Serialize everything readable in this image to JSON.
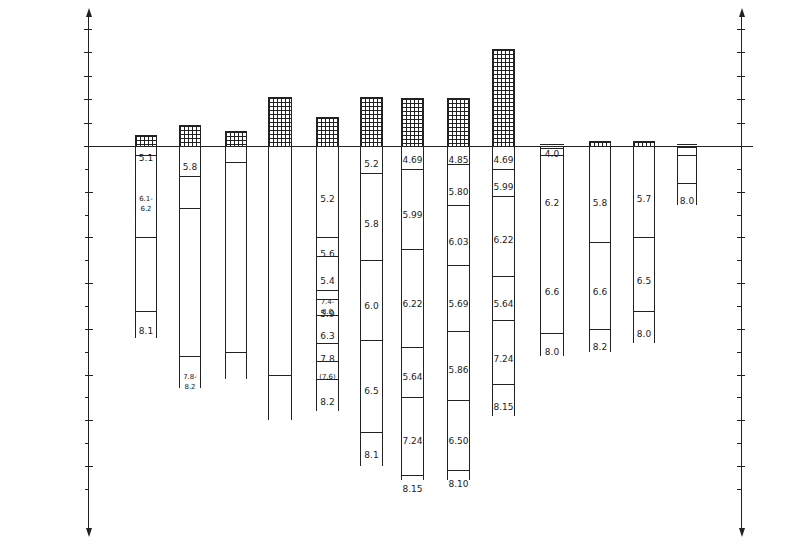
{
  "diagram": {
    "type": "crustal-velocity-columns",
    "y_label_top": "Elevation(km)",
    "y_label_bottom": "Depth(km)",
    "elevation_ticks": [
      "10",
      "8",
      "6",
      "4",
      "2",
      "0"
    ],
    "depth_ticks": [
      "10",
      "20",
      "30",
      "40",
      "50",
      "60",
      "70"
    ],
    "right_elevation_ticks": [
      "10",
      "8",
      "6",
      "4",
      "2",
      "0"
    ],
    "right_depth_ticks": [
      "10",
      "20",
      "30",
      "40",
      "50",
      "60",
      "70"
    ],
    "distance_label": "20",
    "columns": [
      {
        "id": "1",
        "elev_km": 0.9,
        "base_km": 42,
        "boundaries": [
          2,
          20,
          36
        ],
        "labels": [
          {
            "t": "5.1",
            "d": 1
          },
          {
            "t": "6.1-6.2",
            "d": 10
          },
          {
            "t": "8.1",
            "d": 39
          }
        ]
      },
      {
        "id": "2",
        "elev_km": 1.8,
        "base_km": 53,
        "boundaries": [
          6.5,
          13.5,
          46
        ],
        "labels": [
          {
            "t": "5.8",
            "d": 3
          },
          {
            "t": "7.8-8.2",
            "d": 49
          }
        ]
      },
      {
        "id": "3",
        "elev_km": 1.3,
        "base_km": 51,
        "boundaries": [
          3.5,
          45
        ],
        "labels": []
      },
      {
        "id": "4",
        "elev_km": 4.2,
        "base_km": 60,
        "boundaries": [
          50
        ],
        "labels": []
      },
      {
        "id": "5",
        "elev_km": 2.5,
        "base_km": 58,
        "boundaries": [
          20,
          24,
          31.5,
          33.5,
          37,
          43,
          47,
          51
        ],
        "labels": [
          {
            "t": "5.2",
            "d": 10
          },
          {
            "t": "5.6",
            "d": 22
          },
          {
            "t": "5.4",
            "d": 28
          },
          {
            "t": "7.4-8.0",
            "d": 32.5
          },
          {
            "t": "5.9",
            "d": 35.2
          },
          {
            "t": "6.3",
            "d": 40
          },
          {
            "t": "7.8",
            "d": 45
          },
          {
            "t": "(7.6)",
            "d": 49
          },
          {
            "t": "8.2",
            "d": 54.5
          }
        ]
      },
      {
        "id": "6",
        "elev_km": 4.2,
        "base_km": 70,
        "boundaries": [
          6,
          25,
          42.5,
          62.5
        ],
        "labels": [
          {
            "t": "5.2",
            "d": 2.5
          },
          {
            "t": "5.8",
            "d": 15.5
          },
          {
            "t": "6.0",
            "d": 33.5
          },
          {
            "t": "6.5",
            "d": 52
          },
          {
            "t": "8.1",
            "d": 66
          }
        ]
      },
      {
        "id": "7",
        "elev_km": 4.1,
        "base_km": 73,
        "boundaries": [
          5,
          22.5,
          44,
          55,
          72
        ],
        "labels": [
          {
            "t": "4.69",
            "d": 1.5
          },
          {
            "t": "5.99",
            "d": 13.5
          },
          {
            "t": "6.22",
            "d": 33
          },
          {
            "t": "5.64",
            "d": 49
          },
          {
            "t": "7.24",
            "d": 63
          },
          {
            "t": "8.15",
            "d": 73.5
          }
        ]
      },
      {
        "id": "8",
        "elev_km": 4.1,
        "base_km": 73,
        "boundaries": [
          4,
          13,
          26,
          40.5,
          55.5,
          71
        ],
        "labels": [
          {
            "t": "4.85",
            "d": 1.5
          },
          {
            "t": "5.80",
            "d": 8.5
          },
          {
            "t": "6.03",
            "d": 19.5
          },
          {
            "t": "5.69",
            "d": 33
          },
          {
            "t": "5.86",
            "d": 47.5
          },
          {
            "t": "6.50",
            "d": 63
          },
          {
            "t": "8.10",
            "d": 72.5
          }
        ]
      },
      {
        "id": "9",
        "elev_km": 8.3,
        "base_km": 59,
        "boundaries": [
          5,
          11,
          28.5,
          38,
          52
        ],
        "labels": [
          {
            "t": "4.69",
            "d": 1.5
          },
          {
            "t": "5.99",
            "d": 7.5
          },
          {
            "t": "6.22",
            "d": 19
          },
          {
            "t": "5.64",
            "d": 33
          },
          {
            "t": "7.24",
            "d": 45
          },
          {
            "t": "8.15",
            "d": 55.5
          }
        ]
      },
      {
        "id": "10",
        "elev_km": 0,
        "base_km": 46,
        "boundaries": [
          0.4,
          2,
          41
        ],
        "labels": [
          {
            "t": "4.0",
            "d": 0.2
          },
          {
            "t": "6.2",
            "d": 11
          },
          {
            "t": "6.6",
            "d": 30.5
          },
          {
            "t": "8.0",
            "d": 43.5
          }
        ]
      },
      {
        "id": "11",
        "elev_km": 0.4,
        "base_km": 45,
        "boundaries": [
          21,
          40
        ],
        "labels": [
          {
            "t": "5.8",
            "d": 11
          },
          {
            "t": "6.6",
            "d": 30.5
          },
          {
            "t": "8.2",
            "d": 42.5
          }
        ]
      },
      {
        "id": "12",
        "elev_km": 0.4,
        "base_km": 43,
        "boundaries": [
          20,
          36
        ],
        "labels": [
          {
            "t": "5.7",
            "d": 10
          },
          {
            "t": "6.5",
            "d": 28
          },
          {
            "t": "8.0",
            "d": 39.5
          }
        ]
      },
      {
        "id": "13",
        "elev_km": 0,
        "base_km": 13,
        "boundaries": [
          0.3,
          2,
          8
        ],
        "labels": [
          {
            "t": "8.0",
            "d": 10.5
          }
        ]
      }
    ]
  }
}
